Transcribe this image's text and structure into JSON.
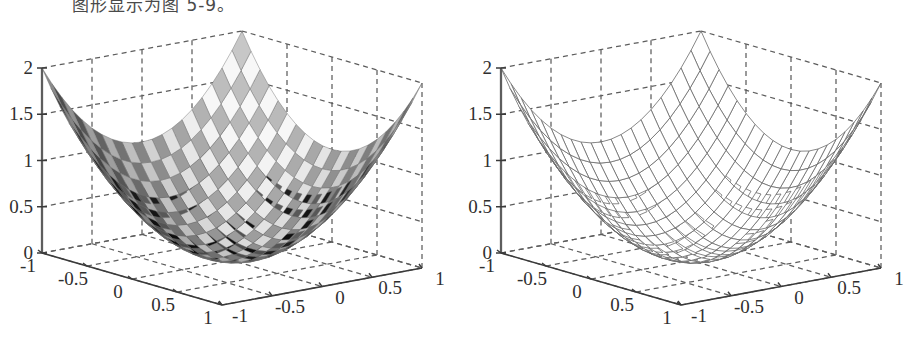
{
  "caption": {
    "text": "图形显示为图 5-9。"
  },
  "figures": [
    {
      "id": "surface-plot",
      "render": "shaded-surface",
      "z_ticks": [
        "2",
        "1.5",
        "1",
        "0.5",
        "0"
      ],
      "x_ticks": [
        "1",
        "0.5",
        "0",
        "-0.5",
        "-1"
      ],
      "y_ticks": [
        "-1",
        "-0.5",
        "0",
        "0.5",
        "1"
      ]
    },
    {
      "id": "mesh-plot",
      "render": "wireframe-mesh",
      "z_ticks": [
        "2",
        "1.5",
        "1",
        "0.5",
        "0"
      ],
      "x_ticks": [
        "1",
        "0.5",
        "0",
        "-0.5",
        "-1"
      ],
      "y_ticks": [
        "-1",
        "-0.5",
        "0",
        "0.5",
        "1"
      ]
    }
  ],
  "chart_data": {
    "type": "surface",
    "title": "",
    "xlabel": "",
    "ylabel": "",
    "zlabel": "",
    "function": "z = x^2 + y^2",
    "xlim": [
      -1,
      1
    ],
    "ylim": [
      -1,
      1
    ],
    "zlim": [
      0,
      2
    ],
    "grid": true,
    "legend": "none",
    "x_tick_values": [
      1,
      0.5,
      0,
      -0.5,
      -1
    ],
    "y_tick_values": [
      -1,
      -0.5,
      0,
      0.5,
      1
    ],
    "z_tick_values": [
      0,
      0.5,
      1,
      1.5,
      2
    ],
    "panels": [
      {
        "name": "shaded-surface",
        "style": "surf",
        "colormap": "gray",
        "sample_n": 21,
        "z_corner_values": {
          "x=-1,y=-1": 2,
          "x=1,y=-1": 2,
          "x=-1,y=1": 2,
          "x=1,y=1": 2,
          "x=0,y=0": 0
        }
      },
      {
        "name": "wireframe-mesh",
        "style": "mesh",
        "colormap": "gray",
        "sample_n": 21,
        "z_corner_values": {
          "x=-1,y=-1": 2,
          "x=1,y=-1": 2,
          "x=-1,y=1": 2,
          "x=0,y=0": 0
        }
      }
    ]
  }
}
